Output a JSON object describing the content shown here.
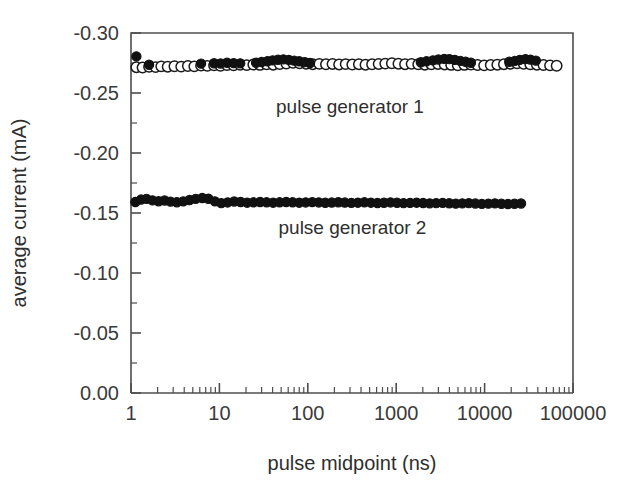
{
  "chart_data": {
    "type": "scatter",
    "title": "",
    "xlabel": "pulse midpoint (ns)",
    "ylabel": "average current (mA)",
    "xscale": "log",
    "yscale": "linear",
    "xlim": [
      1,
      100000
    ],
    "ylim": [
      -0.3,
      0.0
    ],
    "y_axis_inverted": true,
    "grid": false,
    "legend": "inline-annotations",
    "xticks": [
      "1",
      "10",
      "100",
      "1000",
      "10000",
      "100000"
    ],
    "xtick_values": [
      1,
      10,
      100,
      1000,
      10000,
      100000
    ],
    "yticks": [
      "-0.30",
      "-0.25",
      "-0.20",
      "-0.15",
      "-0.10",
      "-0.05",
      "0.00"
    ],
    "ytick_values": [
      -0.3,
      -0.25,
      -0.2,
      -0.15,
      -0.1,
      -0.05,
      0.0
    ],
    "series": [
      {
        "name": "pulse generator 1",
        "marker": "open-circle",
        "annotation": "pulse generator 1",
        "annotation_x": 300,
        "annotation_y": -0.238,
        "x": [
          1.15,
          1.35,
          1.6,
          1.9,
          2.2,
          2.6,
          3.1,
          3.7,
          4.4,
          5.2,
          6.2,
          7.3,
          8.7,
          10.3,
          12.2,
          14.5,
          17.2,
          20.4,
          24.2,
          28.8,
          34.2,
          40.6,
          48.2,
          57.2,
          68,
          80.7,
          95.8,
          113.8,
          135,
          160.4,
          190.4,
          226.1,
          268.4,
          318.7,
          378.4,
          449.3,
          533.5,
          633.4,
          752.1,
          893,
          1060.2,
          1258.9,
          1494.8,
          1774.7,
          2107.1,
          2501.8,
          2970.4,
          3526.6,
          4186.9,
          4971.8,
          5903.5,
          7009.7,
          8323.2,
          9882.4,
          11733,
          13930,
          16538.5,
          19635.5,
          23314.8,
          27683.4,
          32869.2,
          39026.4,
          46336.5,
          55016.7,
          65324.8
        ],
        "y": [
          -0.2715,
          -0.2712,
          -0.2718,
          -0.2716,
          -0.2722,
          -0.2719,
          -0.2723,
          -0.272,
          -0.2725,
          -0.2722,
          -0.2728,
          -0.2726,
          -0.273,
          -0.2727,
          -0.2733,
          -0.273,
          -0.2735,
          -0.2732,
          -0.2737,
          -0.2734,
          -0.2739,
          -0.2736,
          -0.2741,
          -0.2746,
          -0.2752,
          -0.2748,
          -0.2744,
          -0.274,
          -0.2743,
          -0.2739,
          -0.2742,
          -0.2738,
          -0.2741,
          -0.2737,
          -0.274,
          -0.2736,
          -0.2739,
          -0.2742,
          -0.2745,
          -0.2748,
          -0.2744,
          -0.274,
          -0.2743,
          -0.2739,
          -0.2736,
          -0.2739,
          -0.2742,
          -0.2738,
          -0.2734,
          -0.2731,
          -0.2734,
          -0.2737,
          -0.2733,
          -0.273,
          -0.2733,
          -0.2736,
          -0.274,
          -0.2744,
          -0.2747,
          -0.2743,
          -0.2739,
          -0.2736,
          -0.2733,
          -0.273,
          -0.2727
        ]
      },
      {
        "name": "pulse generator 1 overlay",
        "marker": "filled-circle",
        "annotation": "",
        "x": [
          1.15,
          1.6,
          6.2,
          8.7,
          10.3,
          12.2,
          14.5,
          17.2,
          26,
          30,
          35,
          40,
          46,
          53,
          61,
          70,
          80,
          92,
          106,
          1900,
          2200,
          2600,
          3000,
          3500,
          4000,
          4600,
          5300,
          6100,
          7000,
          19000,
          22000,
          25000,
          29000,
          33000,
          38000
        ],
        "y": [
          -0.2805,
          -0.2735,
          -0.2745,
          -0.2748,
          -0.2746,
          -0.2752,
          -0.2749,
          -0.2747,
          -0.2752,
          -0.2758,
          -0.2765,
          -0.2772,
          -0.2777,
          -0.278,
          -0.2776,
          -0.277,
          -0.2764,
          -0.2757,
          -0.275,
          -0.2756,
          -0.2764,
          -0.2772,
          -0.2779,
          -0.2784,
          -0.2782,
          -0.2776,
          -0.2768,
          -0.276,
          -0.2752,
          -0.276,
          -0.2768,
          -0.2776,
          -0.2782,
          -0.2778,
          -0.277
        ]
      },
      {
        "name": "pulse generator 2",
        "marker": "filled-circle",
        "annotation": "pulse generator 2",
        "annotation_x": 320,
        "annotation_y": -0.1375,
        "x": [
          1.12,
          1.3,
          1.5,
          1.75,
          2.05,
          2.4,
          2.8,
          3.3,
          3.9,
          4.6,
          5.4,
          6.4,
          7.5,
          8.9,
          10.5,
          12.4,
          14.7,
          17.4,
          20.6,
          24.4,
          28.9,
          34.2,
          40.5,
          48,
          56.9,
          67.4,
          79.9,
          94.7,
          112.2,
          133,
          157.6,
          186.8,
          221.4,
          262.4,
          311,
          368.6,
          436.9,
          517.8,
          613.7,
          727.4,
          862.1,
          1021.8,
          1211.1,
          1435.5,
          1701.4,
          2016.6,
          2390.1,
          2832.9,
          3357.7,
          3979.8,
          4717.1,
          5591.0,
          6626.9,
          7854.8,
          9310.3,
          11035.9,
          13081.5,
          15506.5,
          18380.5,
          21786.9,
          25823.0
        ],
        "y": [
          -0.1592,
          -0.1612,
          -0.1618,
          -0.1605,
          -0.1598,
          -0.1604,
          -0.1595,
          -0.159,
          -0.1597,
          -0.1608,
          -0.1618,
          -0.1625,
          -0.1619,
          -0.1597,
          -0.1582,
          -0.1588,
          -0.1596,
          -0.1592,
          -0.1586,
          -0.1589,
          -0.1592,
          -0.1589,
          -0.1586,
          -0.1589,
          -0.1592,
          -0.1589,
          -0.1586,
          -0.1588,
          -0.1591,
          -0.1588,
          -0.1585,
          -0.1587,
          -0.159,
          -0.1587,
          -0.1584,
          -0.1586,
          -0.1589,
          -0.1586,
          -0.1583,
          -0.1585,
          -0.1588,
          -0.1585,
          -0.1582,
          -0.1584,
          -0.1586,
          -0.1583,
          -0.158,
          -0.1582,
          -0.1584,
          -0.1581,
          -0.1578,
          -0.158,
          -0.1582,
          -0.1579,
          -0.1576,
          -0.1578,
          -0.158,
          -0.1577,
          -0.1575,
          -0.1577,
          -0.1579
        ]
      }
    ]
  }
}
